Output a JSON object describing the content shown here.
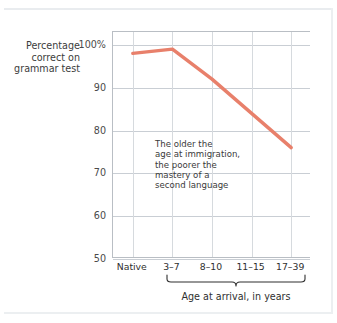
{
  "chart_data": {
    "type": "line",
    "title": "",
    "subtitle": "",
    "ylabel": "Percentage correct on grammar test",
    "xlabel": "Age at arrival, in years",
    "categories": [
      "Native",
      "3–7",
      "8–10",
      "11–15",
      "17–39"
    ],
    "values": [
      98,
      99,
      92,
      84,
      76
    ],
    "series": [
      {
        "name": "Percentage correct on grammar test",
        "values": [
          98,
          99,
          92,
          84,
          76
        ],
        "color": "#e8806b"
      }
    ],
    "ylim": [
      50,
      103
    ],
    "yticks": [
      100,
      90,
      80,
      70,
      60,
      50
    ],
    "ytick_labels": [
      "100%",
      "90",
      "80",
      "70",
      "60",
      "50"
    ],
    "grid": true,
    "legend": false,
    "legend_position": "none",
    "annotations": [
      {
        "name": "trend-callout",
        "lines": [
          "The older the",
          "age at immigration,",
          "the poorer the",
          "mastery of a",
          "second language"
        ]
      }
    ],
    "brace": {
      "label": "Age at arrival, in years",
      "spans_categories": [
        "3–7",
        "17–39"
      ]
    }
  },
  "axes": {
    "y_title_lines": [
      "Percentage",
      "correct on",
      "grammar test"
    ],
    "y_ticks": [
      {
        "label": "100%",
        "value": 100
      },
      {
        "label": "90",
        "value": 90
      },
      {
        "label": "80",
        "value": 80
      },
      {
        "label": "70",
        "value": 70
      },
      {
        "label": "60",
        "value": 60
      },
      {
        "label": "50",
        "value": 50
      }
    ],
    "x_ticks": [
      {
        "label": "Native"
      },
      {
        "label": "3–7"
      },
      {
        "label": "8–10"
      },
      {
        "label": "11–15"
      },
      {
        "label": "17–39"
      }
    ],
    "x_title": "Age at arrival, in years"
  },
  "annotation": {
    "line1": "The older the",
    "line2": "age at immigration,",
    "line3": "the poorer the",
    "line4": "mastery of a",
    "line5": "second language"
  },
  "colors": {
    "line": "#e8806b",
    "axis": "#b9bec4",
    "grid": "#c9ced4",
    "text": "#2f2f2f",
    "background": "#ffffff"
  }
}
